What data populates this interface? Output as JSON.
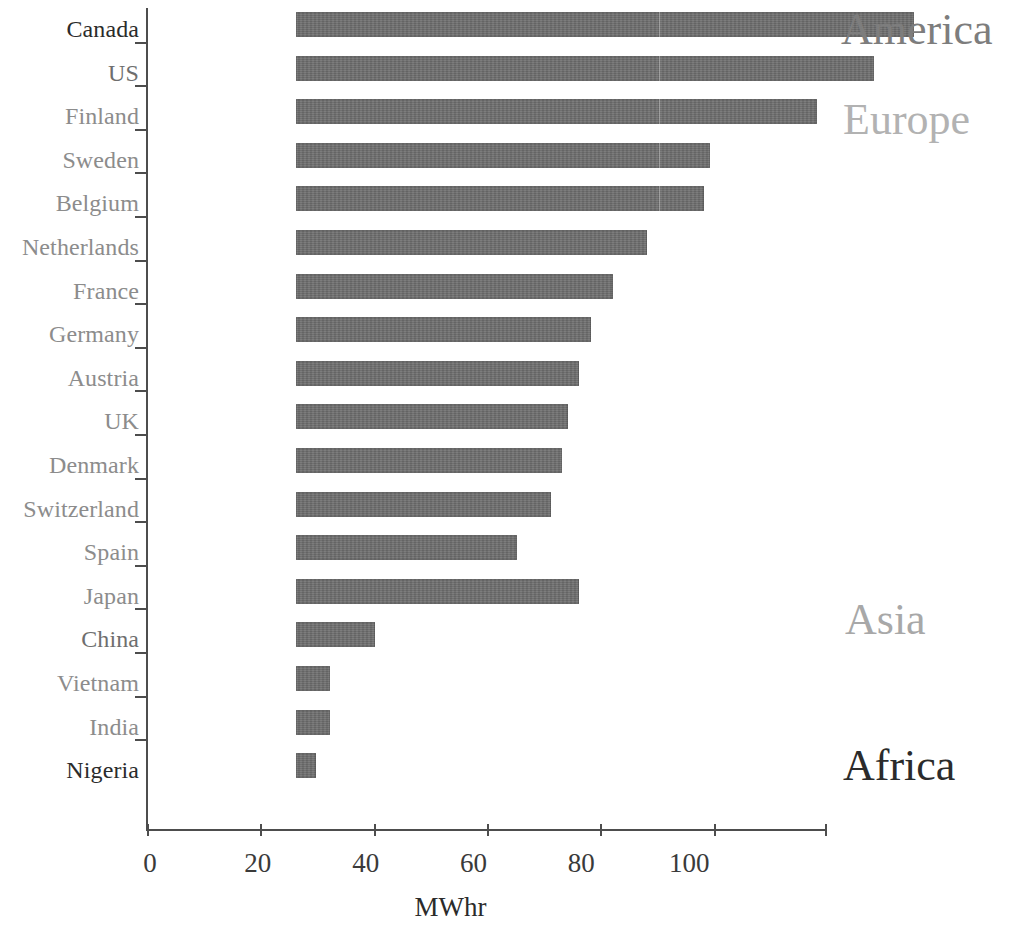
{
  "chart_data": {
    "type": "bar",
    "orientation": "horizontal",
    "title": "",
    "xlabel": "MWhr",
    "ylabel": "",
    "xlim": [
      0,
      120
    ],
    "grid": false,
    "xticks": [
      0,
      20,
      40,
      60,
      80,
      100
    ],
    "xtick_labels": [
      "0",
      "20",
      "40",
      "60",
      "80",
      "100"
    ],
    "categories": [
      "Canada",
      "US",
      "Finland",
      "Sweden",
      "Belgium",
      "Netherlands",
      "France",
      "Germany",
      "Austria",
      "UK",
      "Denmark",
      "Switzerland",
      "Spain",
      "Japan",
      "China",
      "Vietnam",
      "India",
      "Nigeria"
    ],
    "values": [
      109,
      102,
      92,
      73,
      72,
      62,
      56,
      52,
      50,
      48,
      47,
      45,
      39,
      50,
      14,
      6,
      6,
      3.5
    ],
    "bar_color": "#6e6e6e",
    "series": [
      {
        "name": "Electricity consumption per capita",
        "values": [
          109,
          102,
          92,
          73,
          72,
          62,
          56,
          52,
          50,
          48,
          47,
          45,
          39,
          50,
          14,
          6,
          6,
          3.5
        ]
      }
    ],
    "annotations": [
      {
        "text": "America",
        "region": "America",
        "members": [
          "Canada",
          "US"
        ]
      },
      {
        "text": "Europe",
        "region": "Europe",
        "members": [
          "Finland",
          "Sweden",
          "Belgium",
          "Netherlands",
          "France",
          "Germany",
          "Austria",
          "UK",
          "Denmark",
          "Switzerland",
          "Spain"
        ]
      },
      {
        "text": "Asia",
        "region": "Asia",
        "members": [
          "Japan",
          "China",
          "Vietnam",
          "India"
        ]
      },
      {
        "text": "Africa",
        "region": "Africa",
        "members": [
          "Nigeria"
        ]
      }
    ]
  },
  "axis": {
    "x_title": "MWhr"
  },
  "regions": {
    "america": "America",
    "europe": "Europe",
    "asia": "Asia",
    "africa": "Africa"
  }
}
